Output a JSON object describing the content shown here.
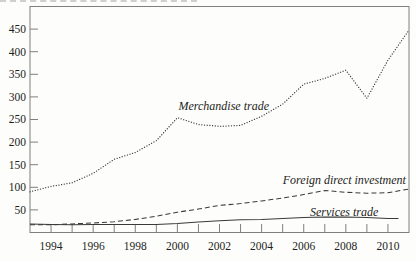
{
  "figure": {
    "background": "#fdfdfb",
    "frame_color": "#7f7f7c",
    "line_color": "#3a3a38",
    "text_color": "#1e1e1c",
    "artifact_color": "#cfcfcb"
  },
  "chart_data": {
    "type": "line",
    "title": "",
    "grid": false,
    "legend_position": "inline-labels",
    "x_axis": {
      "start": 1993,
      "end": 2011,
      "tick_years": [
        1994,
        1995,
        1996,
        1997,
        1998,
        1999,
        2000,
        2001,
        2002,
        2003,
        2004,
        2005,
        2006,
        2007,
        2008,
        2009,
        2010
      ],
      "labeled_years": [
        "1994",
        "1996",
        "1998",
        "2000",
        "2002",
        "2004",
        "2006",
        "2008",
        "2010"
      ]
    },
    "y_axis": {
      "min": 0,
      "max": 500,
      "tick_values": [
        50,
        100,
        150,
        200,
        250,
        300,
        350,
        400,
        450
      ]
    },
    "series": [
      {
        "name": "Merchandise trade",
        "style": "dotted",
        "label_at": {
          "x_year": 2000.05,
          "y_value": 270,
          "anchor": "start"
        },
        "points": [
          [
            1993,
            90
          ],
          [
            1994,
            102
          ],
          [
            1995,
            110
          ],
          [
            1996,
            131
          ],
          [
            1997,
            162
          ],
          [
            1998,
            177
          ],
          [
            1999,
            203
          ],
          [
            2000,
            254
          ],
          [
            2001,
            239
          ],
          [
            2002,
            235
          ],
          [
            2003,
            237
          ],
          [
            2004,
            257
          ],
          [
            2005,
            284
          ],
          [
            2006,
            328
          ],
          [
            2007,
            341
          ],
          [
            2008,
            359
          ],
          [
            2009,
            297
          ],
          [
            2010,
            381
          ],
          [
            2011,
            448
          ]
        ]
      },
      {
        "name": "Foreign direct investment",
        "style": "dashed",
        "label_at": {
          "x_year": 2010.85,
          "y_value": 107,
          "anchor": "end"
        },
        "points": [
          [
            1993,
            17
          ],
          [
            1994,
            17
          ],
          [
            1995,
            19
          ],
          [
            1996,
            21
          ],
          [
            1997,
            24
          ],
          [
            1998,
            29
          ],
          [
            1999,
            36
          ],
          [
            2000,
            45
          ],
          [
            2001,
            52
          ],
          [
            2002,
            60
          ],
          [
            2003,
            64
          ],
          [
            2004,
            70
          ],
          [
            2005,
            76
          ],
          [
            2006,
            84
          ],
          [
            2007,
            93
          ],
          [
            2008,
            89
          ],
          [
            2009,
            87
          ],
          [
            2010,
            88
          ],
          [
            2011,
            96
          ]
        ]
      },
      {
        "name": "Services trade",
        "style": "solid",
        "label_at": {
          "x_year": 2006.3,
          "y_value": 37,
          "anchor": "start"
        },
        "points": [
          [
            1993,
            19
          ],
          [
            1994,
            18
          ],
          [
            1995,
            17
          ],
          [
            1996,
            18
          ],
          [
            1997,
            18
          ],
          [
            1998,
            18
          ],
          [
            1999,
            18
          ],
          [
            2000,
            20
          ],
          [
            2001,
            23
          ],
          [
            2002,
            26
          ],
          [
            2003,
            28
          ],
          [
            2004,
            29
          ],
          [
            2005,
            31
          ],
          [
            2006,
            33
          ],
          [
            2007,
            34
          ],
          [
            2008,
            34
          ],
          [
            2009,
            33
          ],
          [
            2010,
            31
          ],
          [
            2010.5,
            31
          ]
        ]
      }
    ]
  }
}
